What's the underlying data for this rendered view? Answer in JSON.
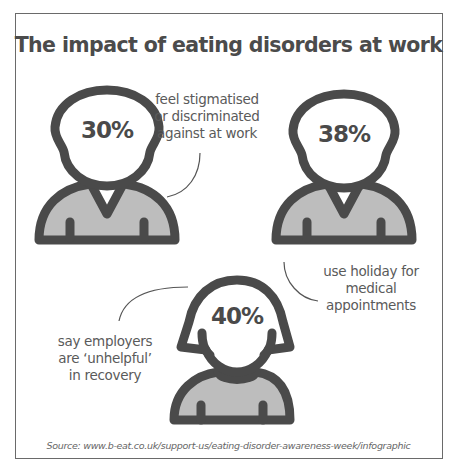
{
  "title": "The impact of eating disorders at work",
  "figures": [
    {
      "percent": "30%",
      "gender": "male",
      "caption_lines": [
        "feel stigmatised",
        "or discriminated",
        "against at work"
      ]
    },
    {
      "percent": "38%",
      "gender": "male",
      "caption_lines": [
        "use holiday for",
        "medical",
        "appointments"
      ]
    },
    {
      "percent": "40%",
      "gender": "female",
      "caption_lines": [
        "say employers",
        "are ‘unhelpful’",
        "in recovery"
      ]
    }
  ],
  "source": "Source: www.b-eat.co.uk/support-us/eating-disorder-awareness-week/infographic",
  "colors": {
    "outline": "#4a4a4a",
    "body_fill": "#bdbdbd",
    "text": "#5a5a5a"
  }
}
